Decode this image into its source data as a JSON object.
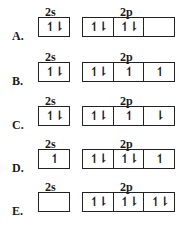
{
  "labels": {
    "s": "2s",
    "p": "2p"
  },
  "options": [
    {
      "letter": "A.",
      "s": "↿⇂",
      "p": [
        "↿⇂",
        "↿⇂",
        ""
      ]
    },
    {
      "letter": "B.",
      "s": "↿⇂",
      "p": [
        "↿⇂",
        "↿",
        "↿"
      ]
    },
    {
      "letter": "C.",
      "s": "↿⇂",
      "p": [
        "↿⇂",
        "↿",
        "⇂"
      ]
    },
    {
      "letter": "D.",
      "s": "↿",
      "p": [
        "↿⇂",
        "↿⇂",
        "↿"
      ]
    },
    {
      "letter": "E.",
      "s": "",
      "p": [
        "↿⇂",
        "↿⇂",
        "↿⇂"
      ]
    }
  ]
}
